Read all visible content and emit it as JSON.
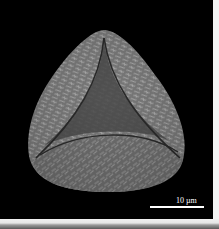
{
  "image": {
    "subject": "pollen-grain-sem-micrograph",
    "background_color": "#000000",
    "surface_color": "#8a8a8a",
    "frame_color": "#f2f2f2"
  },
  "scale_bar": {
    "label": "10 µm",
    "color": "#ffffff"
  }
}
